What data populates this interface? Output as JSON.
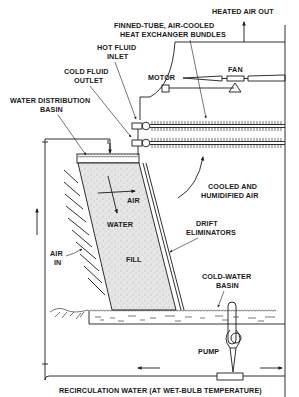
{
  "diagram": {
    "type": "cooling-tower-schematic",
    "labels": {
      "heated_air_out": "HEATED AIR OUT",
      "finned_tube_1": "FINNED-TUBE, AIR-COOLED",
      "finned_tube_2": "HEAT EXCHANGER BUNDLES",
      "hot_fluid_1": "HOT FLUID",
      "hot_fluid_2": "INLET",
      "cold_fluid_1": "COLD FLUID",
      "cold_fluid_2": "OUTLET",
      "motor": "MOTOR",
      "fan": "FAN",
      "water_dist_1": "WATER DISTRIBUTION",
      "water_dist_2": "BASIN",
      "air_flow": "AIR",
      "water_flow": "WATER",
      "cooled_1": "COOLED AND",
      "cooled_2": "HUMIDIFIED AIR",
      "drift_1": "DRIFT",
      "drift_2": "ELIMINATORS",
      "air_in_1": "AIR",
      "air_in_2": "IN",
      "fill": "FILL",
      "cold_basin_1": "COLD-WATER",
      "cold_basin_2": "BASIN",
      "pump": "PUMP",
      "recirculation": "RECIRCULATION WATER (AT WET-BULB TEMPERATURE)"
    },
    "colors": {
      "line": "#1a1a1a",
      "fill_texture": "#d9d9d9",
      "background": "#ffffff"
    }
  }
}
